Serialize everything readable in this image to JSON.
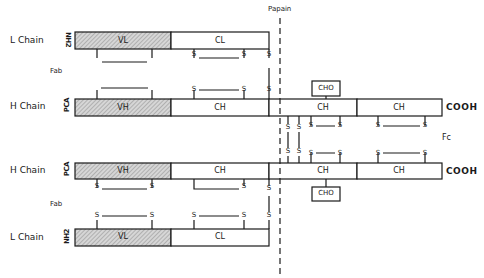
{
  "cleavage": {
    "label": "Papain"
  },
  "fragments": {
    "fab_top": "Fab",
    "fab_bottom": "Fab",
    "fc": "Fc"
  },
  "chains": [
    {
      "name": "L Chain",
      "n_terminus": "NH2",
      "variable": "VL",
      "constant": [
        "CL"
      ]
    },
    {
      "name": "H Chain",
      "n_terminus": "PCA",
      "variable": "VH",
      "constant": [
        "CH",
        "CH",
        "CH"
      ],
      "c_terminus": "COOH"
    },
    {
      "name": "H Chain",
      "n_terminus": "PCA",
      "variable": "VH",
      "constant": [
        "CH",
        "CH",
        "CH"
      ],
      "c_terminus": "COOH"
    },
    {
      "name": "L Chain",
      "n_terminus": "NH2",
      "variable": "VL",
      "constant": [
        "CL"
      ]
    }
  ],
  "carbohydrate": {
    "top": "CHO",
    "bottom": "CHO"
  },
  "disulfide": {
    "label": "S"
  },
  "colors": {
    "stroke": "#1a1a1a",
    "variable_fill": "#c8c8c8",
    "background": "#ffffff"
  }
}
